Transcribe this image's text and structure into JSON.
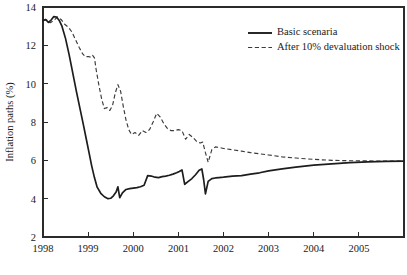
{
  "chart_data": {
    "type": "line",
    "title": "",
    "xlabel": "",
    "ylabel": "Inflation paths (%)",
    "xlim": [
      1998.0,
      2006.0
    ],
    "ylim": [
      2,
      14
    ],
    "grid": false,
    "legend_position": "top-right",
    "x_ticks": [
      1998,
      1999,
      2000,
      2001,
      2002,
      2003,
      2004,
      2005
    ],
    "x_tick_labels": [
      "1998",
      "1999",
      "2000",
      "2001",
      "2002",
      "2003",
      "2004",
      "2005"
    ],
    "y_ticks": [
      2,
      4,
      6,
      8,
      10,
      12,
      14
    ],
    "y_tick_labels": [
      "2",
      "4",
      "6",
      "8",
      "10",
      "12",
      "14"
    ],
    "series": [
      {
        "name": "Basic scenaria",
        "style": "solid",
        "color": "#1d1d1d",
        "x": [
          1998.0,
          1998.06,
          1998.12,
          1998.18,
          1998.24,
          1998.3,
          1998.36,
          1998.42,
          1998.5,
          1998.58,
          1998.66,
          1998.74,
          1998.82,
          1998.9,
          1998.96,
          1999.02,
          1999.08,
          1999.14,
          1999.2,
          1999.28,
          1999.36,
          1999.44,
          1999.5,
          1999.56,
          1999.62,
          1999.66,
          1999.7,
          1999.76,
          1999.84,
          1999.92,
          2000.0,
          2000.08,
          2000.16,
          2000.24,
          2000.32,
          2000.4,
          2000.48,
          2000.56,
          2000.64,
          2000.72,
          2000.8,
          2000.88,
          2000.96,
          2001.02,
          2001.08,
          2001.14,
          2001.22,
          2001.3,
          2001.38,
          2001.46,
          2001.52,
          2001.56,
          2001.6,
          2001.66,
          2001.74,
          2001.82,
          2001.9,
          2002.0,
          2002.2,
          2002.4,
          2002.6,
          2002.8,
          2003.0,
          2003.3,
          2003.6,
          2004.0,
          2004.4,
          2004.8,
          2005.2,
          2005.6,
          2006.0
        ],
        "y": [
          13.3,
          13.35,
          13.2,
          13.32,
          13.5,
          13.48,
          13.3,
          13.0,
          12.35,
          11.5,
          10.55,
          9.6,
          8.7,
          7.8,
          7.1,
          6.4,
          5.7,
          5.1,
          4.6,
          4.28,
          4.1,
          4.0,
          4.02,
          4.15,
          4.35,
          4.62,
          4.05,
          4.3,
          4.48,
          4.52,
          4.55,
          4.58,
          4.62,
          4.7,
          5.2,
          5.18,
          5.12,
          5.1,
          5.15,
          5.18,
          5.22,
          5.28,
          5.35,
          5.42,
          5.5,
          4.75,
          4.9,
          5.05,
          5.25,
          5.48,
          5.55,
          5.0,
          4.25,
          4.9,
          5.05,
          5.08,
          5.1,
          5.12,
          5.18,
          5.2,
          5.28,
          5.35,
          5.45,
          5.55,
          5.65,
          5.75,
          5.82,
          5.88,
          5.92,
          5.95,
          5.96
        ]
      },
      {
        "name": "After 10% devaluation shock",
        "style": "dashed",
        "color": "#3a3a3a",
        "x": [
          1998.0,
          1998.08,
          1998.16,
          1998.24,
          1998.32,
          1998.4,
          1998.48,
          1998.56,
          1998.64,
          1998.72,
          1998.8,
          1998.88,
          1998.94,
          1999.0,
          1999.06,
          1999.1,
          1999.14,
          1999.18,
          1999.24,
          1999.3,
          1999.36,
          1999.42,
          1999.48,
          1999.54,
          1999.6,
          1999.66,
          1999.72,
          1999.78,
          1999.84,
          1999.9,
          1999.96,
          2000.04,
          2000.12,
          2000.2,
          2000.28,
          2000.36,
          2000.44,
          2000.52,
          2000.6,
          2000.68,
          2000.76,
          2000.84,
          2000.92,
          2001.0,
          2001.08,
          2001.16,
          2001.24,
          2001.32,
          2001.4,
          2001.48,
          2001.54,
          2001.6,
          2001.66,
          2001.74,
          2001.82,
          2001.9,
          2002.0,
          2002.2,
          2002.4,
          2002.6,
          2002.8,
          2003.0,
          2003.3,
          2003.6,
          2004.0,
          2004.4,
          2004.8,
          2005.2,
          2005.6,
          2006.0
        ],
        "y": [
          13.3,
          13.32,
          13.18,
          13.3,
          13.48,
          13.35,
          13.1,
          12.95,
          12.7,
          12.3,
          11.9,
          11.55,
          11.4,
          11.42,
          11.38,
          11.48,
          11.35,
          10.7,
          9.9,
          9.2,
          8.7,
          8.75,
          8.6,
          8.85,
          9.5,
          9.95,
          9.6,
          8.8,
          8.1,
          7.6,
          7.35,
          7.45,
          7.3,
          7.55,
          7.45,
          7.6,
          8.0,
          8.45,
          8.25,
          7.9,
          7.65,
          7.55,
          7.55,
          7.6,
          7.55,
          7.1,
          7.35,
          7.2,
          7.0,
          6.9,
          6.95,
          6.4,
          5.9,
          6.55,
          6.7,
          6.68,
          6.62,
          6.55,
          6.48,
          6.4,
          6.34,
          6.28,
          6.18,
          6.12,
          6.05,
          6.0,
          5.98,
          5.97,
          5.96,
          5.96
        ]
      }
    ]
  },
  "legend": {
    "items": [
      {
        "label": "Basic scenaria",
        "style": "solid"
      },
      {
        "label": "After 10% devaluation shock",
        "style": "dashed"
      }
    ]
  },
  "axes": {
    "y_title": "Inflation paths (%)"
  }
}
